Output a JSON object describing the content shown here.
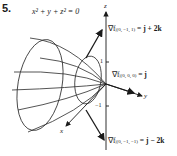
{
  "problem_number": "5.",
  "surface_equation": "x² + y + z² = 0",
  "axes": {
    "x": "x",
    "y": "y",
    "z": "z"
  },
  "ticks": {
    "z_pos": "1",
    "z_neg": "−1"
  },
  "gradients": [
    {
      "nabla": "∇f",
      "point": "|(0, −1, 1)",
      "value": " = j + 2k"
    },
    {
      "nabla": "∇f",
      "point": "|(0, 0, 0)",
      "value": " = j"
    },
    {
      "nabla": "∇f",
      "point": "|(0, −1, −1)",
      "value": " = j − 2k"
    }
  ],
  "colors": {
    "ink": "#1a1a1a",
    "background": "#ffffff"
  }
}
